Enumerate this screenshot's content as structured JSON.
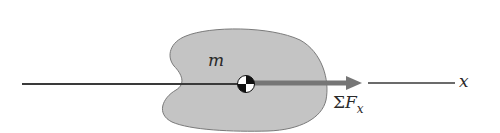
{
  "diagram": {
    "mass_label": "m",
    "force_label_symbol": "Σ",
    "force_label_var": "F",
    "force_label_sub": "x",
    "axis_label": "x",
    "colors": {
      "body_fill": "#c4c4c4",
      "body_stroke": "#6a6a6a",
      "axis": "#3a3a3a",
      "force_arrow": "#767676",
      "com_dark": "#111111",
      "com_light": "#ffffff"
    }
  }
}
